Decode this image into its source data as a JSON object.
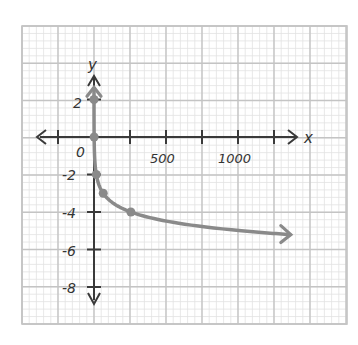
{
  "chart_data": {
    "type": "line",
    "title": "",
    "function": "y = -log_4(x)",
    "xlabel": "x",
    "ylabel": "y",
    "x_ticks": [
      -250,
      0,
      250,
      500,
      750,
      1000,
      1250
    ],
    "x_tick_labels": {
      "0": "0",
      "500": "500",
      "1000": "1000"
    },
    "y_ticks": [
      2,
      0,
      -2,
      -4,
      -6,
      -8
    ],
    "y_tick_labels": [
      "2",
      "0",
      "-2",
      "-4",
      "-6",
      "-8"
    ],
    "xlim": [
      -500,
      1750
    ],
    "ylim": [
      -10,
      6
    ],
    "grid": true,
    "series": [
      {
        "name": "curve",
        "points": [
          {
            "x": 0.0625,
            "y": 2
          },
          {
            "x": 1,
            "y": 0
          },
          {
            "x": 16,
            "y": -2
          },
          {
            "x": 64,
            "y": -3
          },
          {
            "x": 256,
            "y": -4
          }
        ],
        "end_arrow_x": 1360,
        "color": "#8a8a8a"
      }
    ]
  },
  "labels": {
    "x_axis": "x",
    "y_axis": "y",
    "origin": "0",
    "x500": "500",
    "x1000": "1000",
    "y2": "2",
    "ym2": "-2",
    "ym4": "-4",
    "ym6": "-6",
    "ym8": "-8"
  },
  "colors": {
    "grid_major": "#c4c4c4",
    "grid_minor": "#e2e2e2",
    "axis": "#3a3a3a",
    "curve": "#8a8a8a"
  }
}
